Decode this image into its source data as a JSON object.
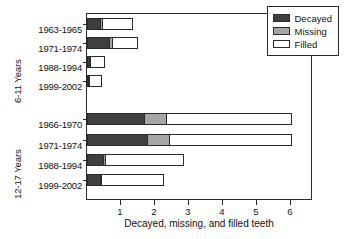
{
  "chart_data": {
    "type": "bar",
    "orientation": "horizontal",
    "stacked": true,
    "title": "",
    "xlabel": "Decayed, missing, and filled teeth",
    "ylabel": "",
    "xlim": [
      0,
      6.65
    ],
    "xticks": [
      1,
      2,
      3,
      4,
      5,
      6
    ],
    "xticklabels": [
      "1",
      "2",
      "3",
      "4",
      "5",
      "6"
    ],
    "grid": false,
    "legend": {
      "position": "top-right",
      "entries": [
        {
          "name": "Decayed",
          "color": "#3f3f3f"
        },
        {
          "name": "Missing",
          "color": "#a6a6a6"
        },
        {
          "name": "Filled",
          "color": "#ffffff"
        }
      ]
    },
    "series": [
      {
        "name": "Decayed",
        "color": "#3f3f3f"
      },
      {
        "name": "Missing",
        "color": "#a6a6a6"
      },
      {
        "name": "Filled",
        "color": "#ffffff"
      }
    ],
    "groups": [
      {
        "label": "6-11 Years",
        "categories": [
          "1963-1965",
          "1971-1974",
          "1988-1994",
          "1999-2002"
        ],
        "values": {
          "Decayed": [
            0.4,
            0.68,
            0.1,
            0.06
          ],
          "Missing": [
            0.1,
            0.12,
            0.02,
            0.02
          ],
          "Filled": [
            0.9,
            0.75,
            0.43,
            0.37
          ]
        },
        "totals": [
          1.4,
          1.55,
          0.55,
          0.45
        ]
      },
      {
        "label": "12-17 Years",
        "categories": [
          "1966-1970",
          "1971-1974",
          "1988-1994",
          "1999-2002"
        ],
        "values": {
          "Decayed": [
            1.7,
            1.8,
            0.5,
            0.4
          ],
          "Missing": [
            0.68,
            0.68,
            0.08,
            0.04
          ],
          "Filled": [
            3.72,
            3.62,
            2.32,
            1.86
          ]
        },
        "totals": [
          6.1,
          6.1,
          2.9,
          2.3
        ]
      }
    ]
  },
  "axis": {
    "xlabel": "Decayed, missing, and filled teeth"
  },
  "legend": {
    "items": [
      {
        "label": "Decayed"
      },
      {
        "label": "Missing"
      },
      {
        "label": "Filled"
      }
    ]
  }
}
